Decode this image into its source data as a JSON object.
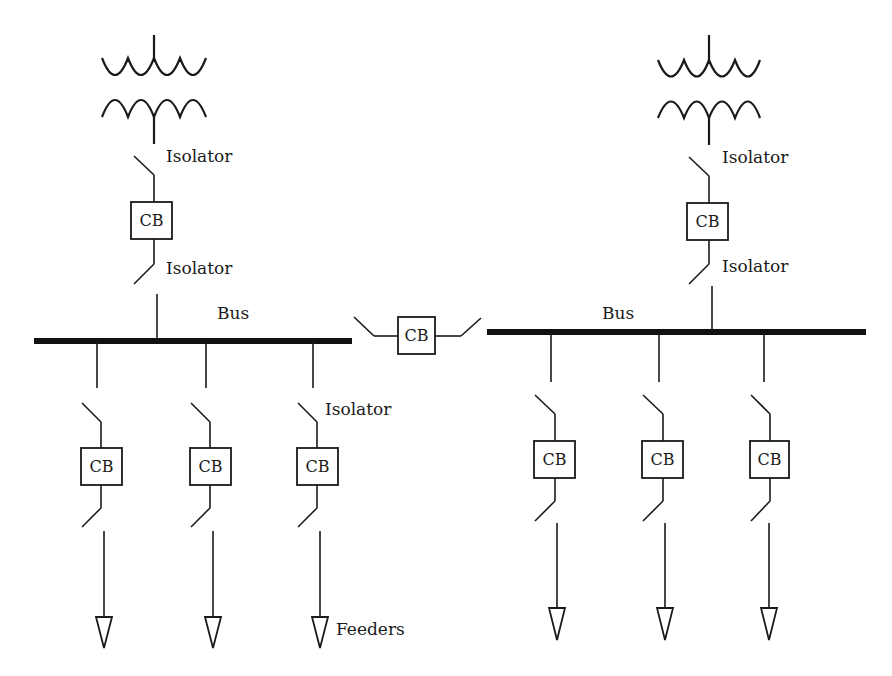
{
  "diagram": {
    "type": "single-line-diagram",
    "labels": {
      "isolator": "Isolator",
      "cb": "CB",
      "bus": "Bus",
      "feeders": "Feeders"
    },
    "left_section": {
      "incomer": {
        "transformer": "transformer-symbol",
        "upper_isolator_label": "Isolator",
        "cb_label": "CB",
        "lower_isolator_label": "Isolator"
      },
      "bus_label": "Bus",
      "feeders": [
        {
          "cb_label": "CB"
        },
        {
          "cb_label": "CB"
        },
        {
          "cb_label": "CB",
          "isolator_label": "Isolator",
          "feeder_label": "Feeders"
        }
      ]
    },
    "bus_coupler": {
      "cb_label": "CB"
    },
    "right_section": {
      "incomer": {
        "transformer": "transformer-symbol",
        "upper_isolator_label": "Isolator",
        "cb_label": "CB",
        "lower_isolator_label": "Isolator"
      },
      "bus_label": "Bus",
      "feeders": [
        {
          "cb_label": "CB"
        },
        {
          "cb_label": "CB"
        },
        {
          "cb_label": "CB"
        }
      ]
    },
    "colors": {
      "line": "#1a1a1a",
      "background": "#ffffff"
    }
  }
}
